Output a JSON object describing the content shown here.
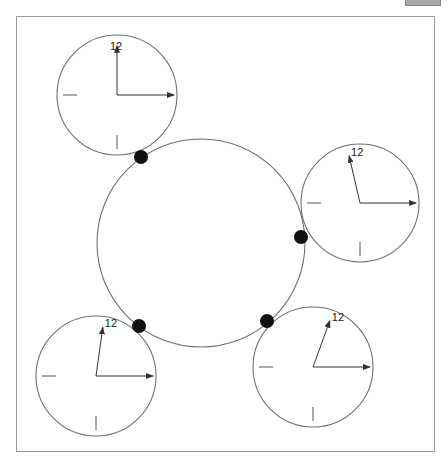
{
  "diagram": {
    "colors": {
      "stroke": "#707070",
      "dot": "#111111",
      "hand": "#333333",
      "frame": "#9a9a9a"
    },
    "ring": {
      "cx": 201,
      "cy": 243,
      "r": 104
    },
    "contact_dots": [
      {
        "x": 141,
        "y": 157
      },
      {
        "x": 301,
        "y": 237
      },
      {
        "x": 139,
        "y": 326
      },
      {
        "x": 267,
        "y": 321
      }
    ],
    "clocks": [
      {
        "id": "clock-top-left",
        "cx": 117,
        "cy": 95,
        "r": 60,
        "label": "12",
        "hour_hand_angle_deg": 0,
        "minute_hand_angle_deg": 90
      },
      {
        "id": "clock-right",
        "cx": 360,
        "cy": 203,
        "r": 59,
        "label": "12",
        "hour_hand_angle_deg": -13,
        "minute_hand_angle_deg": 90
      },
      {
        "id": "clock-bottom-right",
        "cx": 313,
        "cy": 367,
        "r": 60,
        "label": "12",
        "hour_hand_angle_deg": 20,
        "minute_hand_angle_deg": 90
      },
      {
        "id": "clock-bottom-left",
        "cx": 96,
        "cy": 376,
        "r": 60,
        "label": "12",
        "hour_hand_angle_deg": 8,
        "minute_hand_angle_deg": 90
      }
    ]
  }
}
